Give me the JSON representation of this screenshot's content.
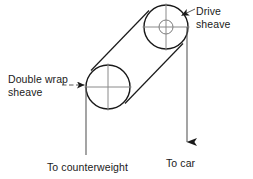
{
  "diagram": {
    "colors": {
      "stroke": "#1a1a1a",
      "thin_stroke": "#4d4d4d",
      "background": "#ffffff",
      "text": "#1a1a1a"
    },
    "labels": {
      "drive_sheave": "Drive\nsheave",
      "double_wrap_sheave": "Double wrap\nsheave",
      "to_counterweight": "To counterweight",
      "to_car": "To car"
    },
    "components": {
      "drive_sheave": {
        "name": "Drive sheave",
        "center_x": 166,
        "center_y": 27,
        "radius": 22,
        "hub_radius": 7,
        "has_hub": true,
        "has_crosshair": true
      },
      "double_wrap_sheave": {
        "name": "Double wrap sheave",
        "center_x": 108,
        "center_y": 87,
        "radius": 22,
        "hub_radius": 0,
        "has_hub": false,
        "has_crosshair": true
      }
    },
    "ropes": {
      "counterweight_line": {
        "name": "Rope to counterweight",
        "x": 86,
        "y_top": 87,
        "y_bottom": 155,
        "arrowhead": false
      },
      "car_line": {
        "name": "Rope to car",
        "x": 187,
        "y_top": 27,
        "y_bottom": 152,
        "arrowhead": true
      }
    },
    "leaders": {
      "drive_sheave_leader": {
        "from_x": 194,
        "from_y": 9,
        "to_x": 180,
        "to_y": 16,
        "arrowhead": true
      },
      "double_wrap_leader": {
        "from_x": 63,
        "from_y": 85,
        "to_x": 86,
        "to_y": 85,
        "arrowhead": true
      }
    }
  }
}
